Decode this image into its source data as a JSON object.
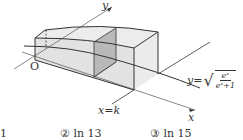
{
  "figure": {
    "axis_y_label": "y",
    "axis_x_label": "x",
    "origin_label": "O",
    "cross_section_label": "x=k",
    "curve_label_prefix": "y=",
    "curve_numerator": "eˣ",
    "curve_denominator": "eˣ+1",
    "curve_equation": "y = sqrt(e^x / (e^x + 1))"
  },
  "choices": [
    {
      "label": "1"
    },
    {
      "label": "② ln 13"
    },
    {
      "label": "③ ln 15"
    }
  ],
  "colors": {
    "line": "#333333",
    "solid_fill": "#e4e4e4",
    "cross_section_fill": "#b8b8b8",
    "axis": "#555555"
  }
}
